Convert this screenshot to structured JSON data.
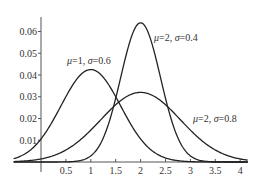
{
  "chart_data": {
    "type": "line",
    "title": "",
    "xlabel": "",
    "ylabel": "",
    "xlim": [
      -0.55,
      4.15
    ],
    "ylim": [
      0,
      0.066
    ],
    "grid": false,
    "x_ticks": [
      0.5,
      1,
      1.5,
      2,
      2.5,
      3,
      3.5,
      4
    ],
    "x_tick_labels": [
      "0.5",
      "1",
      "1.5",
      "2",
      "2.5",
      "3",
      "3.5",
      "4"
    ],
    "y_ticks": [
      0.01,
      0.02,
      0.03,
      0.04,
      0.05,
      0.06
    ],
    "y_tick_labels": [
      "0.01",
      "0.02",
      "0.03",
      "0.04",
      "0.05",
      "0.06"
    ],
    "series": [
      {
        "name": "μ=1, σ=0.6",
        "mu": 1,
        "sigma": 0.6,
        "peak": 0.0425,
        "annotation": {
          "mu_text": "μ",
          "eq1": "=1, ",
          "sigma_text": "σ",
          "eq2": "=0.6"
        }
      },
      {
        "name": "μ=2, σ=0.4",
        "mu": 2,
        "sigma": 0.4,
        "peak": 0.064,
        "annotation": {
          "mu_text": "μ",
          "eq1": "=2, ",
          "sigma_text": "σ",
          "eq2": "=0.4"
        }
      },
      {
        "name": "μ=2, σ=0.8",
        "mu": 2,
        "sigma": 0.8,
        "peak": 0.032,
        "annotation": {
          "mu_text": "μ",
          "eq1": "=2, ",
          "sigma_text": "σ",
          "eq2": "=0.8"
        }
      }
    ],
    "legend_position": "inline annotations"
  },
  "colors": {
    "curve": "#222222",
    "axis": "#555555",
    "text": "#333333",
    "background": "#ffffff"
  }
}
